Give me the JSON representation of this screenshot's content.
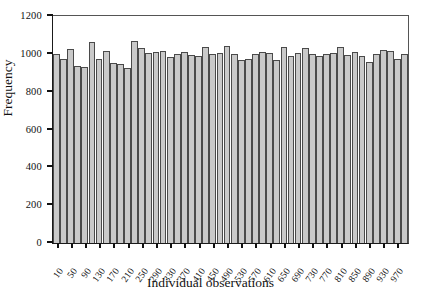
{
  "chart_data": {
    "type": "bar",
    "title": "",
    "xlabel": "Individual observations",
    "ylabel": "Frequency",
    "ylim": [
      0,
      1200
    ],
    "yticks": [
      0,
      200,
      400,
      600,
      800,
      1000,
      1200
    ],
    "xticks": [
      10,
      50,
      90,
      130,
      170,
      210,
      250,
      290,
      330,
      370,
      410,
      450,
      490,
      530,
      570,
      610,
      650,
      690,
      730,
      770,
      810,
      850,
      890,
      930,
      970
    ],
    "xtick_labels": [
      "10",
      "50",
      "90",
      "130",
      "170",
      "210",
      "250",
      "290",
      "330",
      "370",
      "410",
      "450",
      "490",
      "530",
      "570",
      "610",
      "650",
      "690",
      "730",
      "770",
      "810",
      "850",
      "890",
      "930",
      "970"
    ],
    "grid": false,
    "legend": false,
    "bar_color": "#c9c9c9",
    "bar_edge_color": "#4a4a4a",
    "axis_color": "#111111",
    "n_bars": 50,
    "categories": [
      "10",
      "30",
      "50",
      "70",
      "90",
      "110",
      "130",
      "150",
      "170",
      "190",
      "210",
      "230",
      "250",
      "270",
      "290",
      "310",
      "330",
      "350",
      "370",
      "390",
      "410",
      "430",
      "450",
      "470",
      "490",
      "510",
      "530",
      "550",
      "570",
      "590",
      "610",
      "630",
      "650",
      "670",
      "690",
      "710",
      "730",
      "750",
      "770",
      "790",
      "810",
      "830",
      "850",
      "870",
      "890",
      "910",
      "930",
      "950",
      "970",
      "990"
    ],
    "values": [
      1000,
      975,
      1025,
      935,
      930,
      1065,
      975,
      1015,
      950,
      945,
      925,
      1070,
      1030,
      1005,
      1010,
      1015,
      985,
      1000,
      1010,
      995,
      990,
      1035,
      1000,
      1005,
      1040,
      1000,
      965,
      975,
      1000,
      1010,
      1005,
      970,
      1035,
      990,
      1005,
      1030,
      1000,
      990,
      1000,
      1005,
      1035,
      995,
      1010,
      990,
      955,
      1000,
      1020,
      1015,
      975,
      1000
    ]
  }
}
